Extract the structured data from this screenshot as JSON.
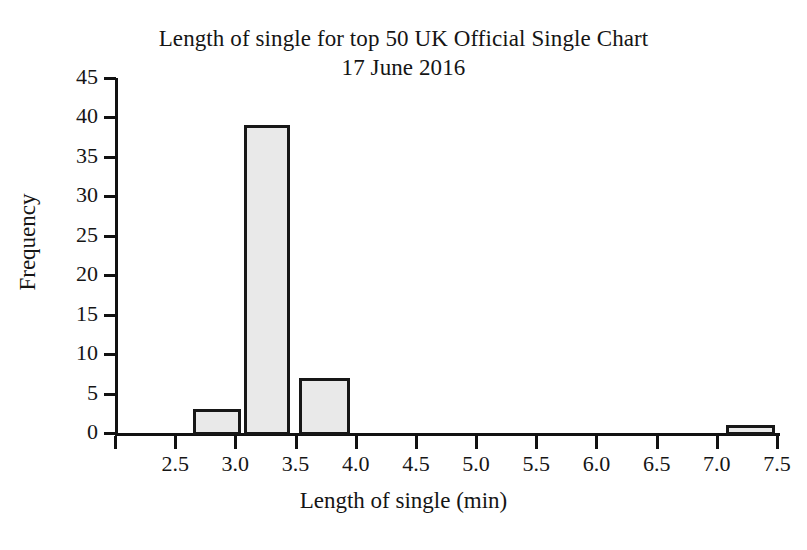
{
  "chart_data": {
    "type": "bar",
    "title": "Length of single for top 50 UK Official Single Chart 17 June 2016",
    "title_line1": "Length of single for top 50 UK Official Single Chart",
    "title_line2": "17 June 2016",
    "xlabel": "Length of single (min)",
    "ylabel": "Frequency",
    "xlim": [
      2.0,
      7.5
    ],
    "ylim": [
      0,
      45
    ],
    "grid": false,
    "legend": null,
    "bar_fill_color": "#e9e9e9",
    "bar_edge_color": "#171717",
    "axis_color": "#111111",
    "background_color": "#ffffff",
    "xticks": [
      2.0,
      2.5,
      3.0,
      3.5,
      4.0,
      4.5,
      5.0,
      5.5,
      6.0,
      6.5,
      7.0,
      7.5
    ],
    "xtick_labels": [
      "",
      "2.5",
      "3.0",
      "3.5",
      "4.0",
      "4.5",
      "5.0",
      "5.5",
      "6.0",
      "6.5",
      "7.0",
      "7.5"
    ],
    "yticks": [
      0,
      5,
      10,
      15,
      20,
      25,
      30,
      35,
      40,
      45
    ],
    "ytick_labels": [
      "0",
      "5",
      "10",
      "15",
      "20",
      "25",
      "30",
      "35",
      "40",
      "45"
    ],
    "bins": [
      {
        "left": 2.65,
        "right": 3.05,
        "value": 3
      },
      {
        "left": 3.07,
        "right": 3.45,
        "value": 39
      },
      {
        "left": 3.53,
        "right": 3.95,
        "value": 7
      },
      {
        "left": 7.08,
        "right": 7.48,
        "value": 1
      }
    ],
    "categories": [
      "2.65-3.05",
      "3.07-3.45",
      "3.53-3.95",
      "7.08-7.48"
    ],
    "values": [
      3,
      39,
      7,
      1
    ]
  }
}
